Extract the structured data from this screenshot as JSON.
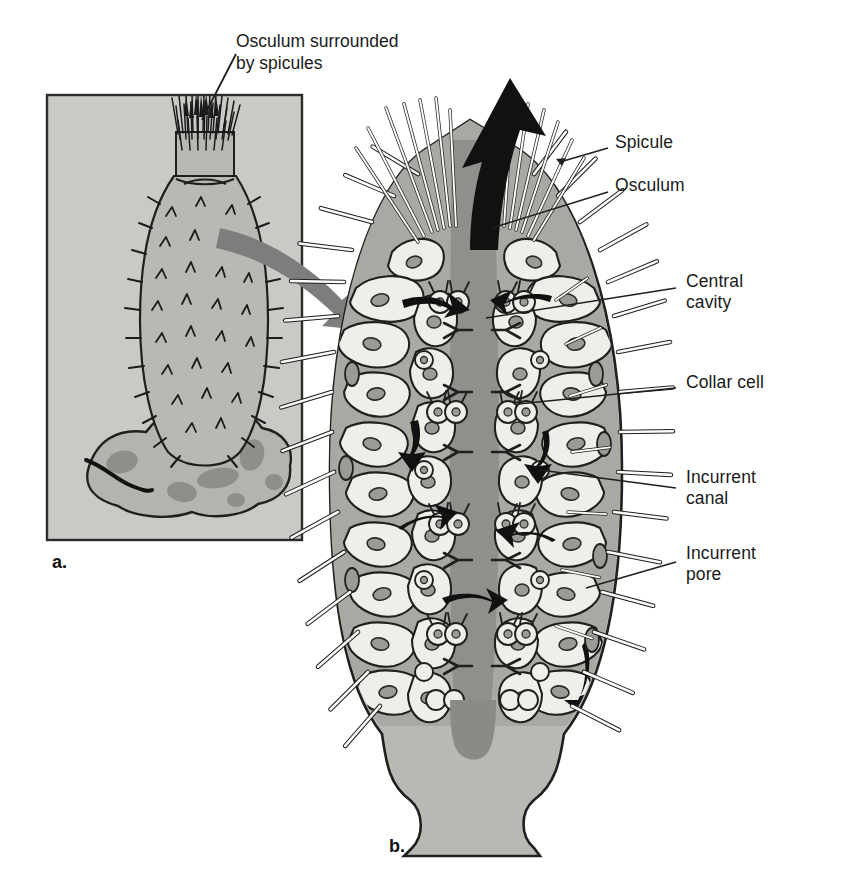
{
  "figure": {
    "background_color": "#ffffff"
  },
  "callout": {
    "text": "Osculum surrounded\nby spicules"
  },
  "panels": [
    {
      "id": "a",
      "letter": "a.",
      "caption": "Whole sponge attached to rock"
    },
    {
      "id": "b",
      "letter": "b.",
      "caption": "Cutaway of sponge body wall"
    }
  ],
  "labels": [
    {
      "id": "spicule",
      "text": "Spicule",
      "x": 615,
      "y": 142
    },
    {
      "id": "osculum",
      "text": "Osculum",
      "x": 615,
      "y": 185
    },
    {
      "id": "central-cavity",
      "text": "Central\ncavity",
      "x": 686,
      "y": 281
    },
    {
      "id": "collar-cell",
      "text": "Collar cell",
      "x": 686,
      "y": 382
    },
    {
      "id": "incurrent-canal",
      "text": "Incurrent\ncanal",
      "x": 686,
      "y": 477
    },
    {
      "id": "incurrent-pore",
      "text": "Incurrent\npore",
      "x": 686,
      "y": 553
    }
  ],
  "colors": {
    "panel_fill": "#c9c9c5",
    "panel_border": "#2b2b2b",
    "sponge_body": "#b9b9b4",
    "rock_fill": "#b4b4af",
    "rock_spot": "#8e8e8a",
    "mesohyl": "#a9a9a4",
    "cell_fill": "#efefea",
    "central_cavity": "#8f8f8b",
    "cavity_dark": "#8a8a86",
    "arrow_black": "#111111",
    "arrow_gray": "#7d7d7d",
    "outline": "#1f1f1f",
    "spicule_white": "#fbfbf9",
    "nucleus": "#9b9b96",
    "leader": "#1f1f1f"
  },
  "structures": {
    "panel_a": {
      "frame": {
        "x": 47,
        "y": 95,
        "width": 255,
        "height": 445
      },
      "osculum_crown": "dense spicule tuft at apex",
      "body": "ovoid spiny sponge",
      "substrate": "mottled rock"
    },
    "panel_b": {
      "osculum_arrow": "large black outflow arrow",
      "spicule_fan": "radiating white spicules at apex",
      "central_cavity": "dark gray spongocoel column",
      "wall_cells": "collar cells and epidermal cells",
      "base": "flared pedestal"
    }
  }
}
